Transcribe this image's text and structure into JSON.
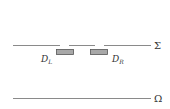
{
  "diagram": {
    "screen": {
      "label": "Σ"
    },
    "plane": {
      "label": "Ω"
    },
    "detectors": [
      {
        "name": "D",
        "subscript": "L"
      },
      {
        "name": "D",
        "subscript": "R"
      }
    ],
    "colors": {
      "line": "#8a8a8a",
      "detector_fill": "#a8a8a8",
      "detector_stroke": "#555555",
      "text": "#333333"
    }
  }
}
